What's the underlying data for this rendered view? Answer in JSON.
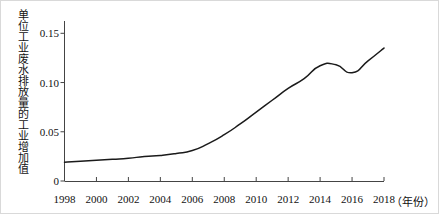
{
  "figure": {
    "frame_color": "#d9d9d9",
    "background": "#ffffff",
    "line_color": "#1a1a1a"
  },
  "axes": {
    "y_axis_title": "单位工业废水排放量的工业增加值",
    "x_axis_title": "（年份）",
    "y_ticks": [
      "0.15",
      "0.10",
      "0.05",
      "0"
    ],
    "x_ticks": [
      "1998",
      "2000",
      "2002",
      "2004",
      "2006",
      "2008",
      "2010",
      "2012",
      "2014",
      "2016",
      "2018"
    ]
  },
  "chart_data": {
    "type": "line",
    "title": "",
    "subtitle": "",
    "xlabel": "（年份）",
    "ylabel": "单位工业废水排放量的工业增加值",
    "xlim": [
      1998,
      2018
    ],
    "ylim": [
      0,
      0.1625
    ],
    "grid": false,
    "legend": null,
    "y_tick_values": [
      0,
      0.05,
      0.1,
      0.15
    ],
    "x_tick_values": [
      1998,
      2000,
      2002,
      2004,
      2006,
      2008,
      2010,
      2012,
      2014,
      2016,
      2018
    ],
    "series": [
      {
        "name": "单位工业废水排放量的工业增加值",
        "color": "#1a1a1a",
        "x": [
          1998,
          1999,
          2000,
          2001,
          2002,
          2003,
          2004,
          2005,
          2006,
          2007,
          2008,
          2009,
          2010,
          2011,
          2012,
          2013,
          2014,
          2015,
          2016,
          2017,
          2018
        ],
        "values": [
          0.019,
          0.02,
          0.021,
          0.022,
          0.023,
          0.025,
          0.026,
          0.028,
          0.031,
          0.038,
          0.047,
          0.058,
          0.07,
          0.082,
          0.094,
          0.104,
          0.117,
          0.118,
          0.11,
          0.122,
          0.135
        ]
      }
    ]
  }
}
